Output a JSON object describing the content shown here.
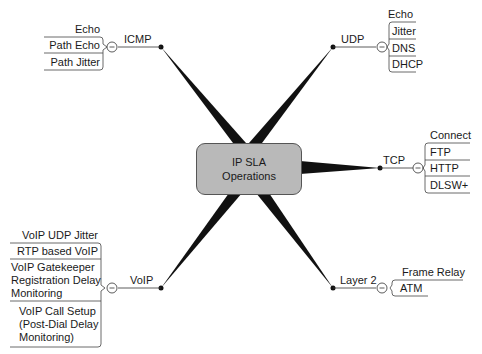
{
  "center": {
    "line1": "IP SLA",
    "line2": "Operations"
  },
  "branches": {
    "icmp": {
      "label": "ICMP",
      "items": [
        "Echo",
        "Path Echo",
        "Path Jitter"
      ]
    },
    "udp": {
      "label": "UDP",
      "items": [
        "Echo",
        "Jitter",
        "DNS",
        "DHCP"
      ]
    },
    "tcp": {
      "label": "TCP",
      "items": [
        "Connect",
        "FTP",
        "HTTP",
        "DLSW+"
      ]
    },
    "voip": {
      "label": "VoIP",
      "items": [
        "VoIP UDP Jitter",
        "RTP based VoIP",
        "VoIP Gatekeeper Registration Delay Monitoring",
        "VoIP Call Setup (Post-Dial Delay Monitoring)"
      ],
      "item_lines": {
        "gk1": "VoIP Gatekeeper",
        "gk2": "Registration Delay",
        "gk3": "Monitoring",
        "cs1": "VoIP Call Setup",
        "cs2": "(Post-Dial Delay",
        "cs3": "Monitoring)"
      }
    },
    "layer2": {
      "label": "Layer 2",
      "items": [
        "Frame Relay",
        "ATM"
      ]
    }
  },
  "colors": {
    "center_fill": "#b9b9b9",
    "line": "#111111"
  }
}
